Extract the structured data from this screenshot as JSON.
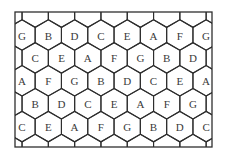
{
  "diagram": {
    "frame": {
      "x": 15,
      "y": 12,
      "width": 197,
      "height": 135
    },
    "colors": {
      "background": "#ffffff",
      "line": "#2e2e2e",
      "text": "#3a3a3a"
    },
    "hex": {
      "orientation": "pointy-top",
      "col_spacing": 26.3,
      "row_spacing": 22.9,
      "first_row_y": 35,
      "even_row_x0": 22,
      "odd_row_x0": 35.2
    },
    "rows": [
      {
        "offset": "even",
        "cells": [
          "G",
          "B",
          "D",
          "C",
          "E",
          "A",
          "F",
          "G"
        ]
      },
      {
        "offset": "odd",
        "cells": [
          "C",
          "E",
          "A",
          "F",
          "G",
          "B",
          "D"
        ]
      },
      {
        "offset": "even",
        "cells": [
          "A",
          "F",
          "G",
          "B",
          "D",
          "C",
          "E",
          "A"
        ]
      },
      {
        "offset": "odd",
        "cells": [
          "B",
          "D",
          "C",
          "E",
          "A",
          "F",
          "G"
        ]
      },
      {
        "offset": "even",
        "cells": [
          "C",
          "E",
          "A",
          "F",
          "G",
          "B",
          "D",
          "C"
        ]
      }
    ]
  }
}
